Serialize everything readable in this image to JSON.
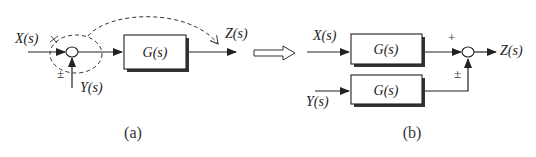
{
  "diagram": {
    "type": "block-diagram-transformation",
    "colors": {
      "line": "#222222",
      "shadow": "#333333",
      "background": "#ffffff"
    },
    "panel_a": {
      "caption": "(a)",
      "input_x": "X(s)",
      "input_y": "Y(s)",
      "output": "Z(s)",
      "block": "G(s)",
      "sum_sign_y": "±",
      "note": "Summing point moved past block (dashed)"
    },
    "transform_arrow": "hollow-right-arrow",
    "panel_b": {
      "caption": "(b)",
      "input_x": "X(s)",
      "input_y": "Y(s)",
      "output": "Z(s)",
      "block_top": "G(s)",
      "block_bottom": "G(s)",
      "sum_sign_top": "+",
      "sum_sign_bottom": "±"
    }
  }
}
